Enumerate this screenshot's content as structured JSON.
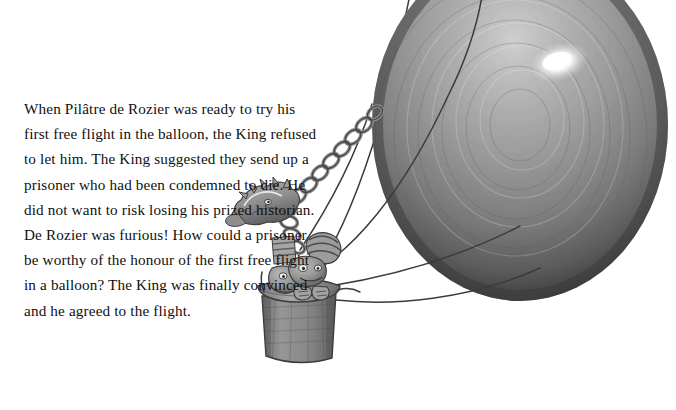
{
  "page": {
    "background_color": "#ffffff",
    "width": 676,
    "height": 410
  },
  "story": {
    "text": "When Pilâtre de Rozier was ready to try his first free flight in the balloon, the King refused to let him. The King suggested they send up a prisoner who had been condemned to die. He did not want to risk losing his prized historian. De Rozier was furious! How could a prisoner be worthy of the honour of the first free flight in a balloon? The King was finally convinced and he agreed to the flight.",
    "lines": [
      "When Pilâtre de Rozier was ready to try",
      "his first free flight in the balloon, the",
      "King refused to let him. The King",
      "suggested they send up a prisoner",
      "who had been condemned to",
      "die. He did not want to risk",
      "losing his prized historian. De",
      "Rozier was furious! How could",
      "a prisoner be worthy of the",
      "honour of the first free flight in",
      "a balloon? The King was finally",
      "convinced and he agreed to",
      "the flight."
    ],
    "text_color": "#101010"
  },
  "illustration": {
    "title": "hot air balloon with basket and two figures",
    "style": "grey pencil and wash drawing",
    "elements": [
      "balloon-envelope",
      "balloon-highlight",
      "rigging-ropes",
      "decorative-chain",
      "dragon-head-ornament",
      "basket",
      "figure-with-striped-cap",
      "figure-second"
    ],
    "colors": {
      "balloon_mid": "#8c8c8c",
      "balloon_dark": "#4a4a4a",
      "balloon_light": "#c9c9c9",
      "highlight": "#ffffff",
      "rope": "#3c3c3c",
      "basket": "#8f8f8f",
      "basket_dark": "#5e5e5e",
      "ornament": "#9a9a9a",
      "outline": "#2e2e2e"
    }
  }
}
